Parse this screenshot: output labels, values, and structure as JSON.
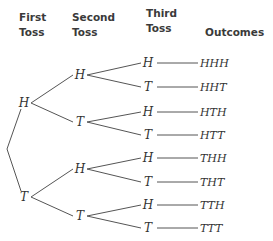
{
  "headers": {
    "first_toss": [
      "First",
      "Toss"
    ],
    "second_toss": [
      "Second",
      "Toss"
    ],
    "third_toss": [
      "Third",
      "Toss"
    ],
    "outcomes": "Outcomes"
  },
  "tree": {
    "first": [
      "H",
      "T"
    ],
    "second": [
      "H",
      "T",
      "H",
      "T"
    ],
    "third": [
      "H",
      "T",
      "H",
      "T",
      "H",
      "T",
      "H",
      "T"
    ],
    "outcomes": [
      "HHH",
      "HHT",
      "HTH",
      "HTT",
      "THH",
      "THT",
      "TTH",
      "TTT"
    ]
  }
}
